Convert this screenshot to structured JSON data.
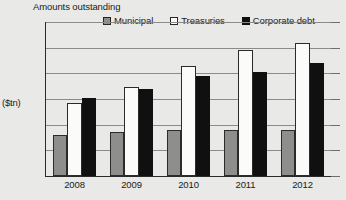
{
  "chart_data": {
    "type": "bar",
    "title": "Amounts outstanding",
    "xlabel": "",
    "ylabel": "($tn)",
    "ylim": [
      0,
      12
    ],
    "yticks": [
      0,
      2,
      4,
      6,
      8,
      10,
      12
    ],
    "ytick_labels": [
      "0",
      "2",
      "4",
      "6",
      "8",
      "10",
      "12"
    ],
    "grid": true,
    "legend_position": "top",
    "categories": [
      "2008",
      "2009",
      "2010",
      "2011",
      "2012"
    ],
    "series": [
      {
        "name": "Municipal",
        "color": "#8e8e8c",
        "values": [
          3.2,
          3.4,
          3.6,
          3.6,
          3.6
        ]
      },
      {
        "name": "Treasuries",
        "color": "#fbfbf9",
        "values": [
          5.7,
          6.9,
          8.6,
          9.8,
          10.4
        ]
      },
      {
        "name": "Corporate debt",
        "color": "#101010",
        "values": [
          6.1,
          6.8,
          7.8,
          8.1,
          8.8
        ]
      }
    ]
  },
  "legend": {
    "items": [
      {
        "label": "Municipal",
        "swatch": "legend-swatch-municipal"
      },
      {
        "label": "Treasuries",
        "swatch": "legend-swatch-treasuries"
      },
      {
        "label": "Corporate debt",
        "swatch": "legend-swatch-corporate"
      }
    ]
  }
}
